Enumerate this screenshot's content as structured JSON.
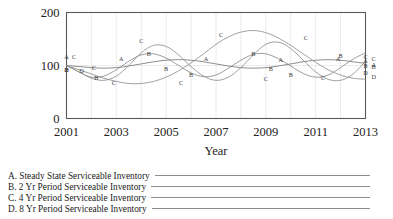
{
  "chart_data": {
    "type": "line",
    "title": "",
    "xlabel": "Year",
    "ylabel": "",
    "xlim": [
      2001,
      2013
    ],
    "ylim": [
      0,
      200
    ],
    "grid": true,
    "x_ticks": [
      "2001",
      "2003",
      "2005",
      "2007",
      "2009",
      "2011",
      "2013"
    ],
    "y_ticks": [
      "0",
      "100",
      "200"
    ],
    "x": [
      2001,
      2001.5,
      2002,
      2002.5,
      2003,
      2003.5,
      2004,
      2004.5,
      2005,
      2005.5,
      2006,
      2006.5,
      2007,
      2007.5,
      2008,
      2008.5,
      2009,
      2009.5,
      2010,
      2010.5,
      2011,
      2011.5,
      2012,
      2012.5,
      2013
    ],
    "legend_position": "below-plot",
    "series": [
      {
        "name": "A",
        "label": "A. Steady State Serviceable Inventory",
        "color": "#7a7a7a",
        "marker_letter": "A",
        "values": [
          100,
          98,
          96,
          95,
          96,
          99,
          103,
          107,
          110,
          111,
          110,
          107,
          103,
          99,
          96,
          95,
          96,
          99,
          103,
          107,
          110,
          111,
          110,
          107,
          104
        ]
      },
      {
        "name": "B",
        "label": "B. 2 Yr Period Serviceable Inventory",
        "color": "#8a8a8a",
        "marker_letter": "B",
        "values": [
          100,
          88,
          78,
          80,
          92,
          108,
          120,
          122,
          114,
          100,
          86,
          79,
          82,
          95,
          110,
          121,
          122,
          113,
          99,
          85,
          78,
          82,
          96,
          112,
          124
        ]
      },
      {
        "name": "C",
        "label": "C. 4 Yr Period Serviceable Inventory",
        "color": "#8f8f8f",
        "marker_letter": "C",
        "values": [
          100,
          88,
          76,
          72,
          80,
          100,
          124,
          138,
          136,
          120,
          98,
          80,
          72,
          78,
          96,
          120,
          140,
          144,
          132,
          110,
          88,
          74,
          72,
          84,
          108
        ]
      },
      {
        "name": "D",
        "label": "D. 8 Yr Period Serviceable Inventory",
        "color": "#909090",
        "marker_letter": "D",
        "values": [
          100,
          92,
          84,
          76,
          70,
          66,
          66,
          70,
          78,
          90,
          105,
          122,
          140,
          154,
          163,
          166,
          162,
          152,
          138,
          122,
          106,
          92,
          82,
          76,
          74
        ]
      }
    ],
    "curve_markers": {
      "A": [
        {
          "x": 2001.0,
          "y": 112,
          "t": "A"
        },
        {
          "x": 2003.2,
          "y": 109,
          "t": "A"
        },
        {
          "x": 2006.6,
          "y": 108,
          "t": "A"
        },
        {
          "x": 2009.6,
          "y": 106,
          "t": "A"
        },
        {
          "x": 2011.9,
          "y": 108,
          "t": "A"
        },
        {
          "x": 2013.0,
          "y": 104,
          "t": "A"
        }
      ],
      "B": [
        {
          "x": 2001.0,
          "y": 88,
          "t": "B"
        },
        {
          "x": 2002.2,
          "y": 72,
          "t": "B"
        },
        {
          "x": 2004.3,
          "y": 118,
          "t": "B"
        },
        {
          "x": 2005.0,
          "y": 90,
          "t": "B"
        },
        {
          "x": 2006.0,
          "y": 78,
          "t": "B"
        },
        {
          "x": 2008.5,
          "y": 118,
          "t": "B"
        },
        {
          "x": 2009.2,
          "y": 90,
          "t": "B"
        },
        {
          "x": 2010.0,
          "y": 78,
          "t": "B"
        },
        {
          "x": 2012.0,
          "y": 115,
          "t": "B"
        },
        {
          "x": 2013.0,
          "y": 96,
          "t": "B"
        }
      ],
      "C": [
        {
          "x": 2001.3,
          "y": 112,
          "t": "C"
        },
        {
          "x": 2002.1,
          "y": 92,
          "t": "C"
        },
        {
          "x": 2002.9,
          "y": 63,
          "t": "C"
        },
        {
          "x": 2004.0,
          "y": 142,
          "t": "C"
        },
        {
          "x": 2005.6,
          "y": 64,
          "t": "C"
        },
        {
          "x": 2007.2,
          "y": 154,
          "t": "C"
        },
        {
          "x": 2009.0,
          "y": 70,
          "t": "C"
        },
        {
          "x": 2010.6,
          "y": 148,
          "t": "C"
        },
        {
          "x": 2011.3,
          "y": 72,
          "t": "C"
        },
        {
          "x": 2013.0,
          "y": 112,
          "t": "C"
        }
      ],
      "D": [
        {
          "x": 2001.0,
          "y": 88,
          "t": "D"
        },
        {
          "x": 2001.6,
          "y": 86,
          "t": "D"
        },
        {
          "x": 2013.0,
          "y": 82,
          "t": "D"
        }
      ]
    }
  },
  "legend": {
    "items": [
      {
        "text": "A. Steady State Serviceable Inventory"
      },
      {
        "text": "B. 2 Yr Period Serviceable Inventory"
      },
      {
        "text": "C. 4 Yr Period Serviceable Inventory"
      },
      {
        "text": "D. 8 Yr Period Serviceable Inventory"
      }
    ]
  }
}
